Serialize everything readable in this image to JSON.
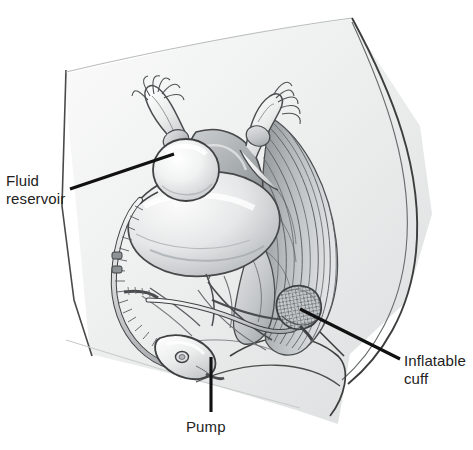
{
  "figure": {
    "style": "grayscale medical line drawing",
    "background_color": "#ffffff",
    "ink_color": "#3a3a3a",
    "label_color": "#222222"
  },
  "labels": [
    {
      "id": "fluid-reservoir",
      "text": "Fluid\nreservoir",
      "leader": {
        "x1": 70,
        "y1": 189,
        "x2": 174,
        "y2": 154
      }
    },
    {
      "id": "inflatable-cuff",
      "text": "Inflatable\ncuff",
      "leader": {
        "x1": 400,
        "y1": 359,
        "x2": 300,
        "y2": 309
      }
    },
    {
      "id": "pump",
      "text": "Pump",
      "leader": {
        "x1": 211,
        "y1": 412,
        "x2": 211,
        "y2": 357
      }
    }
  ],
  "anatomy": [
    {
      "name": "abdominal-wall-outline"
    },
    {
      "name": "uterus"
    },
    {
      "name": "fallopian-tube-left"
    },
    {
      "name": "fallopian-tube-right"
    },
    {
      "name": "fimbriae-left"
    },
    {
      "name": "fimbriae-right"
    },
    {
      "name": "ovary-left"
    },
    {
      "name": "ovary-right"
    },
    {
      "name": "bladder"
    },
    {
      "name": "urethra"
    },
    {
      "name": "vagina"
    },
    {
      "name": "rectum"
    },
    {
      "name": "sacrum-muscle-striations"
    },
    {
      "name": "pubic-bone"
    },
    {
      "name": "perineum"
    },
    {
      "name": "thigh"
    }
  ],
  "device": [
    {
      "name": "fluid-reservoir-balloon"
    },
    {
      "name": "connecting-tubing"
    },
    {
      "name": "control-pump"
    },
    {
      "name": "pump-button"
    },
    {
      "name": "inflatable-cuff-band"
    }
  ]
}
